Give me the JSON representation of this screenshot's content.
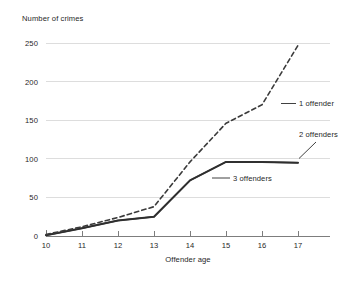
{
  "chart_data": {
    "type": "line",
    "title": "",
    "xlabel": "Offender age",
    "ylabel": "Number of crimes",
    "x": [
      10,
      11,
      12,
      13,
      14,
      15,
      16,
      17
    ],
    "xtick_labels": [
      "10",
      "11",
      "12",
      "13",
      "14",
      "15",
      "16",
      "17"
    ],
    "ytick_labels": [
      "0",
      "50",
      "100",
      "150",
      "200",
      "250"
    ],
    "ytick_values": [
      0,
      50,
      100,
      150,
      200,
      250
    ],
    "xlim": [
      10,
      17
    ],
    "ylim": [
      0,
      250
    ],
    "grid": "horizontal",
    "legend_position": "inline-annotations",
    "series": [
      {
        "name": "1 offender",
        "style": "dashed",
        "color": "#3b3b3b",
        "values": [
          2,
          12,
          24,
          38,
          96,
          146,
          170,
          247
        ]
      },
      {
        "name": "2 offenders",
        "style": "solid",
        "color": "#3b3b3b",
        "values": [
          1,
          10,
          20,
          25,
          72,
          96,
          96,
          95
        ]
      },
      {
        "name": "3 offenders",
        "style": "solid",
        "color": "#3b3b3b",
        "values": [
          1,
          10,
          20,
          25,
          72,
          96,
          96,
          95
        ]
      }
    ],
    "annotations": [
      {
        "text": "1 offender",
        "series": "1 offender",
        "anchor_age": 16.1,
        "anchor_value": 170
      },
      {
        "text": "2 offenders",
        "series": "2 offenders",
        "anchor_age": 16.9,
        "anchor_value": 96
      },
      {
        "text": "3 offenders",
        "series": "3 offenders",
        "anchor_age": 14.6,
        "anchor_value": 88
      }
    ]
  },
  "axes": {
    "y_title": "Number of crimes",
    "x_title": "Offender age"
  },
  "colors": {
    "ink": "#1f1f1f",
    "grid": "#d5d5d5",
    "axis": "#6f6f6f",
    "series": "#3b3b3b",
    "background": "#ffffff"
  }
}
